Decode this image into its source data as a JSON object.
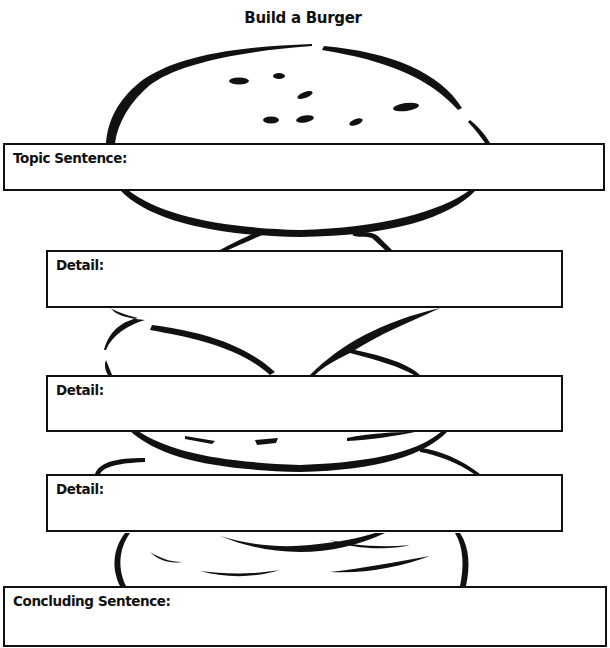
{
  "page": {
    "title": "Build a Burger"
  },
  "organizer": {
    "topic": {
      "label": "Topic Sentence:",
      "value": ""
    },
    "details": [
      {
        "label": "Detail:",
        "value": ""
      },
      {
        "label": "Detail:",
        "value": ""
      },
      {
        "label": "Detail:",
        "value": ""
      }
    ],
    "conclusion": {
      "label": "Concluding Sentence:",
      "value": ""
    }
  },
  "illustration": {
    "subject": "burger-outline",
    "parts": [
      "top-bun",
      "lettuce",
      "patty",
      "cheese",
      "bottom-bun"
    ],
    "stroke_color": "#111111"
  }
}
